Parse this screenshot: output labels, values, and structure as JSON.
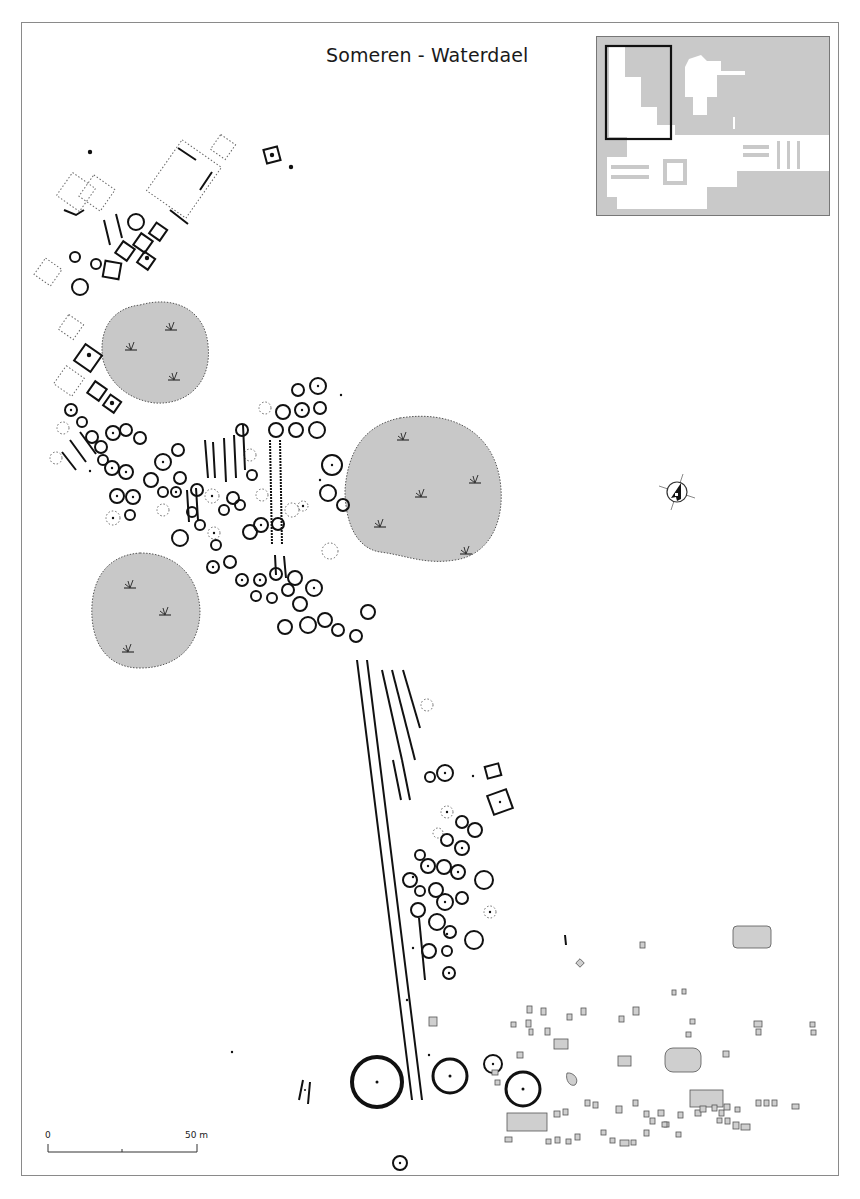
{
  "map": {
    "title": "Someren - Waterdael",
    "scale": {
      "start_label": "0",
      "end_label": "50 m"
    },
    "north_arrow": "north-arrow-icon",
    "inset": {
      "description": "overview map with extent rectangle",
      "extent_box": "black rectangle top-left"
    },
    "legend_features": [
      {
        "type": "shaded-area",
        "description": "vegetation / grass areas",
        "fill": "#c8c8c8",
        "count": 4
      },
      {
        "type": "ring-ditch",
        "description": "circular barrows (urnfield ring ditches)"
      },
      {
        "type": "rectangular-enclosure",
        "description": "square/rectangular ditched enclosures"
      },
      {
        "type": "long-bed",
        "description": "parallel linear ditches (long beds)"
      },
      {
        "type": "pit",
        "description": "small grey rectangular features"
      }
    ],
    "colors": {
      "background": "#ffffff",
      "frame": "#8a8a8a",
      "feature_stroke": "#111111",
      "shaded_area": "#c8c8c8",
      "inset_bg": "#c9c9c9",
      "pit_fill": "#cfcfcf"
    }
  }
}
